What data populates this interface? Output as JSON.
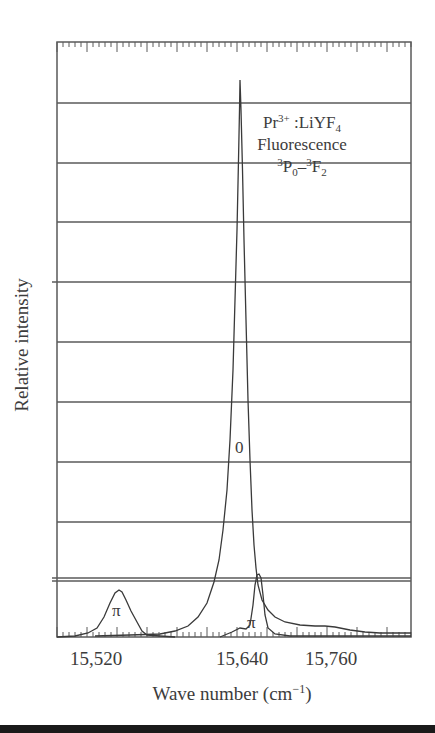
{
  "chart_data": {
    "type": "line",
    "title": "",
    "xlabel": "Wave number (cm⁻¹)",
    "xlabel_base": "Wave number (cm",
    "xlabel_sup": "−1",
    "xlabel_close": ")",
    "ylabel": "Relative intensity",
    "x_tick_labels": [
      "15,520",
      "15,640",
      "15,760"
    ],
    "xlim": [
      15460,
      15840
    ],
    "ylim": [
      0,
      1
    ],
    "grid": "horizontal",
    "annotation": {
      "line1_base": "Pr",
      "line1_sup": "3+",
      "line1_rest": " :LiYF",
      "line1_sub": "4",
      "line2": "Fluorescence",
      "line3_sup1": "3",
      "line3_p": "P",
      "line3_sub1": "0",
      "line3_dash": "–",
      "line3_sup2": "3",
      "line3_f": "F",
      "line3_sub2": "2",
      "full_text": "Pr3+:LiYF4 Fluorescence 3P0–3F2"
    },
    "series": [
      {
        "name": "0 (sigma/orthogonal)",
        "label": "0",
        "x": [
          15460,
          15520,
          15560,
          15590,
          15610,
          15620,
          15630,
          15636,
          15640,
          15644,
          15650,
          15660,
          15680,
          15720,
          15780,
          15840
        ],
        "values": [
          0.0,
          0.005,
          0.02,
          0.06,
          0.14,
          0.3,
          0.62,
          0.9,
          1.0,
          0.88,
          0.55,
          0.2,
          0.08,
          0.05,
          0.03,
          0.02
        ]
      },
      {
        "name": "π polarization",
        "label": "π",
        "x": [
          15460,
          15490,
          15510,
          15520,
          15530,
          15545,
          15560,
          15620,
          15640,
          15648,
          15652,
          15656,
          15662,
          15680,
          15840
        ],
        "values": [
          0.0,
          0.01,
          0.05,
          0.08,
          0.06,
          0.02,
          0.0,
          0.01,
          0.03,
          0.08,
          0.11,
          0.08,
          0.03,
          0.0,
          0.0
        ]
      }
    ],
    "peak_labels": [
      {
        "text": "π",
        "near_x": 15520
      },
      {
        "text": "π",
        "near_x": 15650
      },
      {
        "text": "0",
        "near_x": 15640
      }
    ]
  }
}
